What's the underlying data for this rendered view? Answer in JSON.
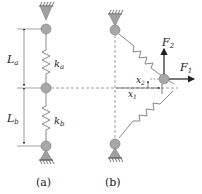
{
  "diagram": {
    "panel_a": {
      "caption": "(a)",
      "length_top": "L",
      "length_top_sub": "a",
      "length_bottom": "L",
      "length_bottom_sub": "b",
      "spring_top": "k",
      "spring_top_sub": "a",
      "spring_bottom": "k",
      "spring_bottom_sub": "b"
    },
    "panel_b": {
      "caption": "(b)",
      "force_vertical": "F",
      "force_vertical_sub": "2",
      "force_horizontal": "F",
      "force_horizontal_sub": "1",
      "disp_vertical": "x",
      "disp_vertical_sub": "2",
      "disp_horizontal": "x",
      "disp_horizontal_sub": "1"
    },
    "colors": {
      "line": "#888888",
      "node_fill": "#a8a8a8",
      "arrow": "#222222",
      "support_fill": "#a0a0a0"
    }
  }
}
